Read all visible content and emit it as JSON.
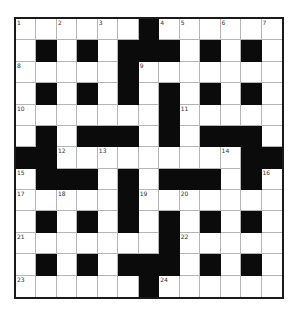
{
  "puzzle": {
    "rows": 13,
    "cols": 13,
    "colors": {
      "block": "#0b0b0b",
      "cell": "#ffffff",
      "gridline": "#b5b5b5",
      "border": "#1a1a1a",
      "number": "#333333"
    },
    "grid": [
      "WWWWWWBWWWWWW",
      "WBWBWBBBWBWBW",
      "WWWWWBWWWWWWW",
      "WBWBWBWBWBWBW",
      "WWWWWWWBWWWWW",
      "WBWBBBWBWBBBW",
      "BBWWWWWWWWWBB",
      "WBBBWBWBBBWBW",
      "WWWWWBWWWWWWW",
      "WBWBWBWBWBWBW",
      "WWWWWWWBWWWWW",
      "WBWBWBBBWBWBW",
      "WWWWWWBWWWWWW"
    ],
    "numbers": [
      {
        "n": "1",
        "r": 0,
        "c": 0
      },
      {
        "n": "2",
        "r": 0,
        "c": 2
      },
      {
        "n": "3",
        "r": 0,
        "c": 4
      },
      {
        "n": "4",
        "r": 0,
        "c": 7
      },
      {
        "n": "5",
        "r": 0,
        "c": 8
      },
      {
        "n": "6",
        "r": 0,
        "c": 10
      },
      {
        "n": "7",
        "r": 0,
        "c": 12
      },
      {
        "n": "8",
        "r": 2,
        "c": 0
      },
      {
        "n": "9",
        "r": 2,
        "c": 6
      },
      {
        "n": "10",
        "r": 4,
        "c": 0
      },
      {
        "n": "11",
        "r": 4,
        "c": 8
      },
      {
        "n": "12",
        "r": 6,
        "c": 2
      },
      {
        "n": "13",
        "r": 6,
        "c": 4
      },
      {
        "n": "14",
        "r": 6,
        "c": 10
      },
      {
        "n": "15",
        "r": 7,
        "c": 0
      },
      {
        "n": "16",
        "r": 7,
        "c": 12
      },
      {
        "n": "17",
        "r": 8,
        "c": 0
      },
      {
        "n": "18",
        "r": 8,
        "c": 2
      },
      {
        "n": "19",
        "r": 8,
        "c": 6
      },
      {
        "n": "20",
        "r": 8,
        "c": 8
      },
      {
        "n": "21",
        "r": 10,
        "c": 0
      },
      {
        "n": "22",
        "r": 10,
        "c": 8
      },
      {
        "n": "23",
        "r": 12,
        "c": 0
      },
      {
        "n": "24",
        "r": 12,
        "c": 7
      }
    ]
  }
}
